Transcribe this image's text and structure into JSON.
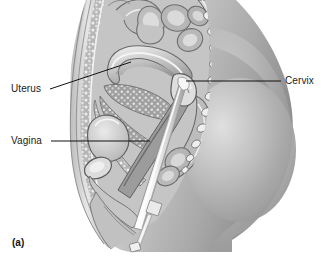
{
  "figure": {
    "panel_label": "(a)",
    "type": "medical-illustration",
    "view": "sagittal-section-female-pelvis",
    "palette": {
      "background": "#ffffff",
      "ink": "#111111",
      "skin_light": "#e2e2e2",
      "skin_mid": "#b9b9b9",
      "skin_dark": "#8d8d8d",
      "tissue_light": "#d4d4d4",
      "tissue_mid": "#a6a6a6",
      "tissue_dark": "#6f6f6f",
      "outline": "#5a5a5a",
      "instrument": "#f1f1f1",
      "instrument_shade": "#b4b4b4"
    }
  },
  "labels": [
    {
      "id": "uterus",
      "text": "Uterus",
      "x": 11,
      "y": 84,
      "leader": {
        "x1": 50,
        "y1": 89,
        "x2": 131,
        "y2": 62
      }
    },
    {
      "id": "vagina",
      "text": "Vagina",
      "x": 11,
      "y": 136,
      "leader": {
        "x1": 51,
        "y1": 141,
        "x2": 150,
        "y2": 141
      }
    },
    {
      "id": "cervix",
      "text": "Cervix",
      "x": 285,
      "y": 76,
      "leader": {
        "x1": 281,
        "y1": 81,
        "x2": 186,
        "y2": 81
      }
    }
  ],
  "anatomy": [
    {
      "id": "abdominal-wall",
      "name": "anterior abdominal wall"
    },
    {
      "id": "intestines",
      "name": "intestinal loops"
    },
    {
      "id": "uterus-body",
      "name": "uterus"
    },
    {
      "id": "cervix-structure",
      "name": "cervix"
    },
    {
      "id": "vagina-canal",
      "name": "vagina"
    },
    {
      "id": "bladder",
      "name": "urinary bladder"
    },
    {
      "id": "pubic-bone",
      "name": "pubic symphysis"
    },
    {
      "id": "rectum",
      "name": "rectum"
    },
    {
      "id": "sacrum",
      "name": "sacrum and coccyx"
    },
    {
      "id": "buttock",
      "name": "gluteal region"
    }
  ],
  "instrument": {
    "id": "uterine-probe",
    "name": "uterine sound / cannula",
    "tip_at": "cervix",
    "angle_deg": 63
  }
}
